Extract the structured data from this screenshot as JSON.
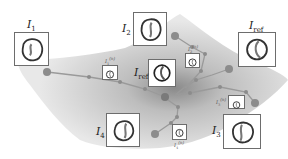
{
  "figure": {
    "colors": {
      "manifold_light": "#e6e6e6",
      "manifold_dark": "#8a8a8a",
      "node": "#8c8c8c",
      "path": "#9a9a9a",
      "frame_border": "#6d6d6d"
    },
    "large_labels": [
      {
        "id": "I1",
        "base": "I",
        "sub": "1"
      },
      {
        "id": "I2",
        "base": "I",
        "sub": "2"
      },
      {
        "id": "Iref_right",
        "base": "I",
        "sub": "ref"
      },
      {
        "id": "Iref_center",
        "base": "I",
        "sub": "ref"
      },
      {
        "id": "I3",
        "base": "I",
        "sub": "3"
      },
      {
        "id": "I4",
        "base": "I",
        "sub": "4"
      }
    ],
    "small_labels": [
      {
        "id": "I1n",
        "base": "I",
        "sub": "1",
        "sup": "(n)"
      },
      {
        "id": "I2n",
        "base": "I",
        "sub": "2",
        "sup": "(n)"
      },
      {
        "id": "I3n",
        "base": "I",
        "sub": "3",
        "sup": "(n)"
      },
      {
        "id": "I4n",
        "base": "I",
        "sub": "4",
        "sup": "(n)"
      }
    ]
  }
}
